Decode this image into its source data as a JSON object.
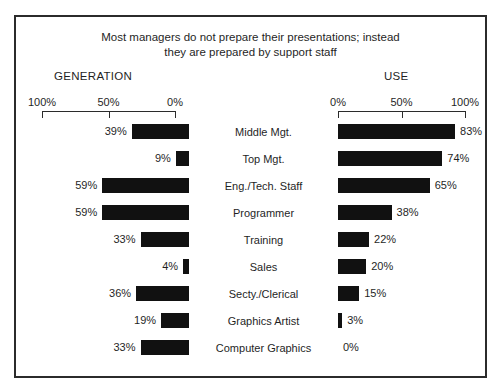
{
  "chart_data": {
    "type": "bar",
    "title": "Most managers do not prepare their presentations; instead they are prepared by support staff",
    "title_lines": [
      "Most managers do not prepare their presentations; instead",
      "they are prepared by support staff"
    ],
    "orientation": "horizontal",
    "layout": "diverging-bidirectional",
    "grid": false,
    "legend": false,
    "categories": [
      "Middle Mgt.",
      "Top Mgt.",
      "Eng./Tech. Staff",
      "Programmer",
      "Training",
      "Sales",
      "Secty./Clerical",
      "Graphics Artist",
      "Computer Graphics"
    ],
    "series": [
      {
        "name": "GENERATION",
        "side": "left",
        "axis_direction": "reversed",
        "xlim": [
          0,
          100
        ],
        "tick_values": [
          100,
          50,
          0
        ],
        "tick_labels": [
          "100%",
          "50%",
          "0%"
        ],
        "values": [
          39,
          9,
          59,
          59,
          33,
          4,
          36,
          19,
          33
        ],
        "value_labels": [
          "39%",
          "9%",
          "59%",
          "59%",
          "33%",
          "4%",
          "36%",
          "19%",
          "33%"
        ]
      },
      {
        "name": "USE",
        "side": "right",
        "axis_direction": "normal",
        "xlim": [
          0,
          100
        ],
        "tick_values": [
          0,
          50,
          100
        ],
        "tick_labels": [
          "0%",
          "50%",
          "100%"
        ],
        "values": [
          83,
          74,
          65,
          38,
          22,
          20,
          15,
          3,
          0
        ],
        "value_labels": [
          "83%",
          "74%",
          "65%",
          "38%",
          "22%",
          "20%",
          "15%",
          "3%",
          "0%"
        ]
      }
    ],
    "xlabel": "",
    "ylabel": "",
    "colors": {
      "bar": "#111111",
      "text": "#1f1f1f",
      "frame": "#2b2b2b",
      "background": "#ffffff"
    }
  }
}
